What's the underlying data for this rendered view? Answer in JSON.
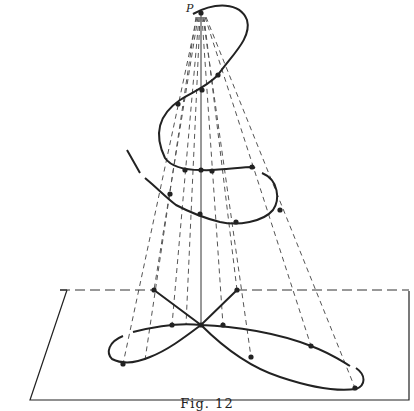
{
  "figure": {
    "caption": "Fig. 12",
    "point_label": "P",
    "colors": {
      "ink": "#222222",
      "background": "#ffffff"
    },
    "apex": [
      201,
      13
    ],
    "plane": [
      [
        30,
        400
      ],
      [
        409,
        400
      ],
      [
        409,
        291
      ],
      [
        67,
        290
      ]
    ],
    "axis": [
      [
        201,
        13
      ],
      [
        201,
        325
      ]
    ],
    "helix_path": "M193,14 C215,2 240,2 247,20 C252,38 232,55 218,75 C205,88 192,92 180,100 C158,115 154,135 165,158 C172,168 186,170 201,170 C220,171 240,167 253,167 L255,168 M262,173 C279,180 280,200 273,210 C263,222 238,226 220,222 C204,218 193,214 176,205 C168,199 161,192 152,184 L145,178 M140,173 L127,150",
    "shadow_path": "M154,290 L201,325 L237,290 M201,325 C185,337 168,350 150,357 C136,363 122,364 112,359 C106,353 108,342 123,336 M133,332 C160,325 185,323 201,325 C235,326 278,333 311,346 C330,353 340,360 350,366 M356,368 C366,375 366,385 356,389 C335,392 310,387 280,377 C252,368 226,350 201,325",
    "shadow_dashed": "M60,290 L154,290 M237,290 L409,290",
    "rays": [
      [
        [
          197,
          17
        ],
        [
          123,
          364
        ]
      ],
      [
        [
          198,
          17
        ],
        [
          154,
          290
        ]
      ],
      [
        [
          199,
          17
        ],
        [
          172,
          325
        ]
      ],
      [
        [
          200,
          17
        ],
        [
          186,
          325
        ]
      ],
      [
        [
          202,
          17
        ],
        [
          223,
          325
        ]
      ],
      [
        [
          203,
          17
        ],
        [
          251,
          357
        ]
      ],
      [
        [
          204,
          17
        ],
        [
          237,
          290
        ]
      ],
      [
        [
          205,
          17
        ],
        [
          311,
          346
        ]
      ],
      [
        [
          206,
          17
        ],
        [
          355,
          388
        ]
      ],
      [
        [
          196,
          17
        ],
        [
          145,
          360
        ]
      ]
    ],
    "helix_points": [
      [
        201,
        13
      ],
      [
        218,
        75
      ],
      [
        202,
        90
      ],
      [
        178,
        104
      ],
      [
        185,
        170
      ],
      [
        201,
        170
      ],
      [
        212,
        171
      ],
      [
        252,
        167
      ],
      [
        280,
        210
      ],
      [
        236,
        222
      ],
      [
        200,
        214
      ],
      [
        170,
        194
      ]
    ],
    "shadow_points": [
      [
        154,
        290
      ],
      [
        237,
        290
      ],
      [
        172,
        325
      ],
      [
        201,
        325
      ],
      [
        223,
        325
      ],
      [
        311,
        346
      ],
      [
        251,
        357
      ],
      [
        123,
        364
      ],
      [
        355,
        388
      ]
    ]
  }
}
